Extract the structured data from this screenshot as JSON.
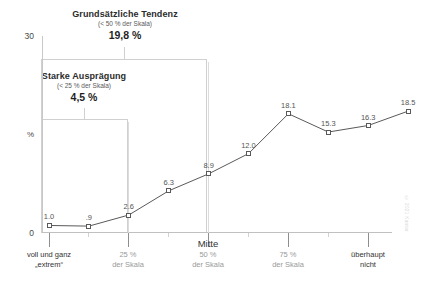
{
  "chart_data": {
    "type": "line",
    "title": "",
    "xlabel": "",
    "ylabel": "%",
    "ylim": [
      0,
      30
    ],
    "grid": "vertical-only",
    "legend": "none",
    "categories": [
      "1",
      "2",
      "3",
      "4",
      "5",
      "6",
      "7",
      "8",
      "9",
      "10"
    ],
    "values": [
      1.0,
      0.9,
      2.6,
      6.3,
      8.9,
      12.0,
      18.1,
      15.3,
      16.3,
      18.5
    ],
    "point_labels": [
      "1.0",
      ".9",
      "2.6",
      "6.3",
      "8.9",
      "12.0",
      "18.1",
      "15.3",
      "16.3",
      "18.5"
    ],
    "series": [
      {
        "name": "Verteilung",
        "values": [
          1.0,
          0.9,
          2.6,
          6.3,
          8.9,
          12.0,
          18.1,
          15.3,
          16.3,
          18.5
        ],
        "marker": "open-square",
        "color": "#595959"
      }
    ],
    "y_ticks": [
      "0",
      "30"
    ],
    "y_tick_values": [
      0,
      30
    ],
    "x_category_labels": [
      {
        "line1": "voll und ganz",
        "line2": "„extrem“",
        "tone": "dark",
        "at_point": 1
      },
      {
        "line1": "25 %",
        "line2": "der Skala",
        "tone": "grey",
        "at_point": 3
      },
      {
        "line1": "50 %",
        "line2": "der Skala",
        "tone": "grey",
        "heading": "Mitte",
        "at_point": 5
      },
      {
        "line1": "75 %",
        "line2": "der Skala",
        "tone": "grey",
        "at_point": 7
      },
      {
        "line1": "überhaupt",
        "line2": "nicht",
        "tone": "dark",
        "at_point": 9
      }
    ],
    "annotations": [
      {
        "id": "grundsaetzliche-tendenz",
        "title": "Grundsätzliche Tendenz",
        "subtitle": "(< 50 % der Skala)",
        "value": "19,8 %",
        "span_from_point": 1,
        "span_to_point": 5
      },
      {
        "id": "starke-auspraegung",
        "title": "Starke Ausprägung",
        "subtitle": "(< 25 % der Skala)",
        "value": "4,5 %",
        "span_from_point": 1,
        "span_to_point": 3
      }
    ],
    "gridline_positions": [
      "25 % der Skala",
      "50 % der Skala"
    ],
    "colors": {
      "line": "#595959",
      "marker_fill": "#ffffff",
      "axis": "#c8c8c8",
      "gridline": "#dcdcdc",
      "label_dark": "#333333",
      "label_grey": "#9a9a9a"
    }
  },
  "watermark": {
    "text": "© 2021 Kantar"
  }
}
